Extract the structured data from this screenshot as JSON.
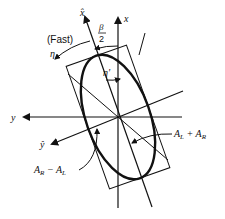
{
  "diagram": {
    "labels": {
      "x_axis": "x",
      "y_axis": "y",
      "x_hat": "x̂",
      "y_hat": "ŷ",
      "fast": "(Fast)",
      "eta": "η",
      "eta_prime": "η'",
      "beta": "β",
      "two": "2",
      "al_plus_ar": "A",
      "al_plus_ar_sub1": "L",
      "al_plus_ar_mid": " + A",
      "al_plus_ar_sub2": "R",
      "ar_minus_al": "A",
      "ar_minus_al_sub1": "R",
      "ar_minus_al_mid": " − A",
      "ar_minus_al_sub2": "L"
    },
    "colors": {
      "stroke": "#111111",
      "background": "#ffffff"
    }
  }
}
